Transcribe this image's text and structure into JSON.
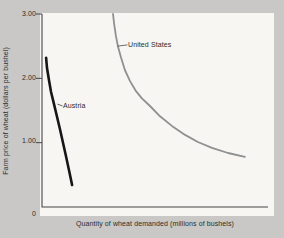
{
  "figure": {
    "background_color": "#c9c8c6",
    "plot_background_color": "#f7f6f3",
    "axis_color": "#454545",
    "text_color": "#2e2d2b"
  },
  "chart_data": {
    "type": "line",
    "title": "",
    "xlabel": "Quantity of wheat demanded (millions of bushels)",
    "ylabel": "Farm price of wheat (dollars per bushel)",
    "x_axis": {
      "tick_labels_shown": false,
      "note": "x values below are percent of axis length (no numeric scale printed on chart)",
      "range_pct": [
        0,
        100
      ]
    },
    "ylim": [
      0,
      3.0
    ],
    "yticks": [
      {
        "value": 3.0,
        "label": "3.00"
      },
      {
        "value": 2.0,
        "label": "2.00"
      },
      {
        "value": 1.0,
        "label": "1.00"
      },
      {
        "value": 0,
        "label": "0"
      }
    ],
    "grid": false,
    "legend": "inline curve labels with leader lines",
    "series": [
      {
        "name": "Austria",
        "color": "#161616",
        "stroke_width": 2.6,
        "points": [
          [
            1.8,
            2.32
          ],
          [
            2.2,
            2.16
          ],
          [
            3.1,
            1.97
          ],
          [
            4.0,
            1.79
          ],
          [
            5.3,
            1.6
          ],
          [
            6.6,
            1.41
          ],
          [
            8.0,
            1.2
          ],
          [
            9.3,
            1.0
          ],
          [
            10.6,
            0.79
          ],
          [
            11.9,
            0.58
          ],
          [
            13.3,
            0.34
          ]
        ]
      },
      {
        "name": "United States",
        "color": "#8f9091",
        "stroke_width": 1.8,
        "points": [
          [
            31.4,
            3.0
          ],
          [
            31.9,
            2.85
          ],
          [
            32.7,
            2.66
          ],
          [
            33.6,
            2.5
          ],
          [
            35.0,
            2.32
          ],
          [
            36.7,
            2.13
          ],
          [
            38.9,
            1.96
          ],
          [
            41.6,
            1.8
          ],
          [
            44.2,
            1.69
          ],
          [
            47.8,
            1.57
          ],
          [
            52.2,
            1.41
          ],
          [
            57.5,
            1.26
          ],
          [
            63.3,
            1.12
          ],
          [
            69.0,
            1.01
          ],
          [
            75.2,
            0.92
          ],
          [
            82.3,
            0.84
          ],
          [
            89.8,
            0.78
          ]
        ]
      }
    ],
    "annotations": [
      {
        "text": "Austria",
        "leader_from": [
          6.8,
          1.6
        ],
        "leader_to": [
          9.1,
          1.57
        ]
      },
      {
        "text": "United States",
        "leader_from": [
          33.4,
          2.5
        ],
        "leader_to": [
          37.8,
          2.52
        ]
      }
    ]
  }
}
